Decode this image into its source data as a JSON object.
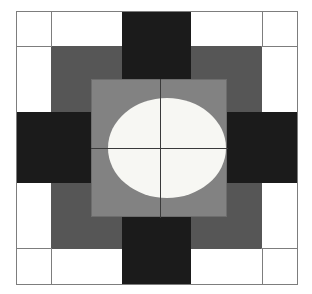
{
  "figure": {
    "canvas": {
      "width": 312,
      "height": 294,
      "background": "#ffffff"
    },
    "frame": {
      "label": "outer-border",
      "x": 16,
      "y": 11,
      "width": 282,
      "height": 274,
      "border_color": "#7d7d7d",
      "border_width": 1,
      "fill": "#ffffff"
    },
    "palette": {
      "white": "#ffffff",
      "black": "#1b1b1b",
      "mid_gray": "#565656",
      "light_gray": "#828282",
      "disc": "#f7f7f3",
      "hairline": "#7d7d7d",
      "crosshair": "#3a3a3a"
    },
    "grid": {
      "label": "corner-cell-rules",
      "vertical_rule_x": [
        51,
        262
      ],
      "horizontal_rule_y": [
        46,
        249
      ],
      "color": "#7d7d7d",
      "thickness": 1
    },
    "bands": {
      "vertical_black_bar": {
        "x": 122,
        "y": 11,
        "width": 69,
        "height": 274,
        "color": "#1b1b1b"
      },
      "horizontal_black_bar": {
        "x": 16,
        "y": 112,
        "width": 282,
        "height": 71,
        "color": "#1b1b1b"
      },
      "mid_gray_square": {
        "x": 51,
        "y": 46,
        "width": 211,
        "height": 203,
        "color": "#565656"
      }
    },
    "center_target": {
      "label": "light-gray-target-square",
      "x": 91,
      "y": 79,
      "width": 136,
      "height": 138,
      "color": "#828282",
      "border_color": "#6d6d6d",
      "disc": {
        "label": "white-focus-disc",
        "cx": 167,
        "cy": 148,
        "rx": 59,
        "ry": 50,
        "color": "#f7f7f3"
      },
      "crosshair": {
        "label": "registration-crosshair",
        "center_x": 160,
        "center_y": 148,
        "color": "#3a3a3a",
        "thickness": 1
      }
    }
  }
}
